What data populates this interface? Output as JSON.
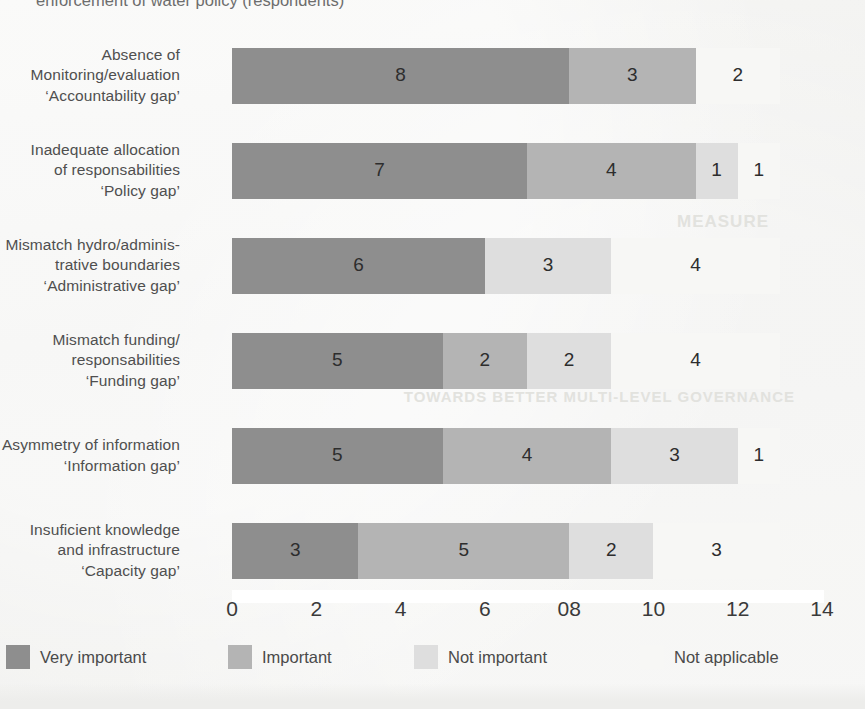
{
  "caption_partial": "enforcement of water policy (respondents)",
  "ghost_text": {
    "line1": "MEASURE",
    "line2": "TOWARDS BETTER MULTI-LEVEL GOVERNANCE",
    "line3": "FIGURE 1"
  },
  "chart_data": {
    "type": "bar",
    "orientation": "horizontal",
    "stacked": true,
    "title": "",
    "xlabel": "",
    "ylabel": "",
    "xlim": [
      0,
      14
    ],
    "grid": false,
    "legend_position": "bottom",
    "categories": [
      "Absence of Monitoring/evaluation 'Accountability gap'",
      "Inadequate allocation of responsabilities 'Policy gap'",
      "Mismatch hydro/administrative boundaries 'Administrative gap'",
      "Mismatch funding/responsabilities 'Funding gap'",
      "Asymmetry of information 'Information gap'",
      "Insuficient knowledge and infrastructure 'Capacity gap'"
    ],
    "category_lines": [
      [
        "Absence of",
        "Monitoring/evaluation",
        "‘Accountability gap’"
      ],
      [
        "Inadequate allocation",
        "of responsabilities",
        "‘Policy gap’"
      ],
      [
        "Mismatch hydro/adminis-",
        "trative boundaries",
        "‘Administrative gap’"
      ],
      [
        "Mismatch funding/",
        "responsabilities",
        "‘Funding gap’"
      ],
      [
        "Asymmetry of information",
        "‘Information gap’"
      ],
      [
        "Insuficient knowledge",
        "and infrastructure",
        "‘Capacity gap’"
      ]
    ],
    "series": [
      {
        "name": "Very important",
        "color": "#8e8e8e",
        "values": [
          8,
          7,
          6,
          5,
          5,
          3
        ]
      },
      {
        "name": "Important",
        "color": "#b4b4b4",
        "values": [
          3,
          4,
          0,
          2,
          4,
          5
        ]
      },
      {
        "name": "Not important",
        "color": "#dedede",
        "values": [
          0,
          1,
          3,
          2,
          3,
          2
        ]
      },
      {
        "name": "Not applicable",
        "color": "#f7f7f5",
        "values": [
          2,
          1,
          4,
          4,
          1,
          3
        ]
      }
    ],
    "x_ticks": [
      "0",
      "2",
      "4",
      "6",
      "08",
      "10",
      "12",
      "14"
    ],
    "x_tick_values": [
      0,
      2,
      4,
      6,
      8,
      10,
      12,
      14
    ]
  },
  "legend": {
    "items": [
      {
        "label": "Very important",
        "color": "#8e8e8e"
      },
      {
        "label": "Important",
        "color": "#b4b4b4"
      },
      {
        "label": "Not important",
        "color": "#dedede"
      },
      {
        "label": "Not applicable",
        "color": "#f7f7f5"
      }
    ]
  }
}
